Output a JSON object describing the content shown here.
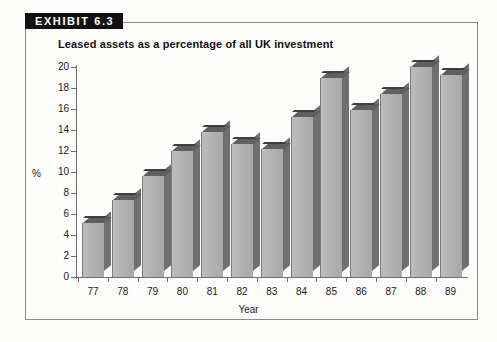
{
  "exhibit": {
    "tag": "EXHIBIT 6.3"
  },
  "chart_data": {
    "type": "bar",
    "title": "Leased assets as a percentage of all UK investment",
    "xlabel": "Year",
    "ylabel": "%",
    "categories": [
      "77",
      "78",
      "79",
      "80",
      "81",
      "82",
      "83",
      "84",
      "85",
      "86",
      "87",
      "88",
      "89"
    ],
    "values": [
      5.1,
      7.3,
      9.6,
      12.0,
      13.8,
      12.7,
      12.2,
      15.2,
      19.0,
      15.9,
      17.4,
      20.0,
      19.2
    ],
    "ylim": [
      0,
      20
    ],
    "yticks": [
      0,
      2,
      4,
      6,
      8,
      10,
      12,
      14,
      16,
      18,
      20
    ],
    "ytick_labels": [
      "0",
      "2",
      "4",
      "6",
      "8",
      "10",
      "12",
      "14",
      "16",
      "18",
      "20"
    ],
    "grid": false,
    "legend": "none",
    "bar_style": "3d",
    "colors": {
      "bar_front": "#b3b3b3",
      "bar_side": "#6f6f6f",
      "bar_top": "#5f5f5f",
      "axis": "#6d6d6d",
      "text": "#1a1a1a",
      "tag_background": "#111111",
      "tag_text": "#ffffff",
      "frame": "#8a8a8a",
      "background": "#fdfdfc"
    }
  }
}
